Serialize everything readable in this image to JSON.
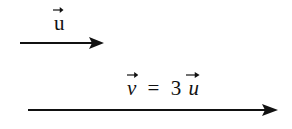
{
  "diagram": {
    "vector_u": {
      "label": "u",
      "has_arrow_accent": true,
      "arrow": {
        "x1": 20,
        "y1": 43,
        "x2": 103,
        "y2": 43
      }
    },
    "vector_v": {
      "label_lhs": "v",
      "equals": "=",
      "coefficient": "3",
      "label_rhs": "u",
      "arrow": {
        "x1": 28,
        "y1": 110,
        "x2": 277,
        "y2": 110
      }
    },
    "stroke_color": "#111111"
  }
}
